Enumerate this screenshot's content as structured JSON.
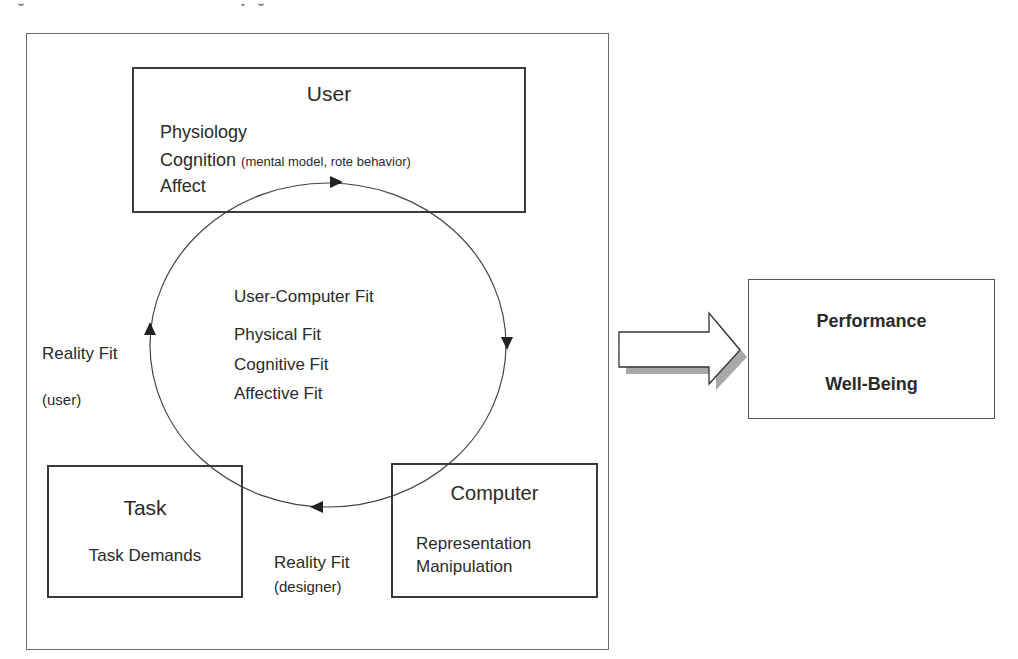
{
  "diagram": {
    "user_box": {
      "title": "User",
      "items": [
        {
          "main": "Physiology",
          "detail": ""
        },
        {
          "main": "Cognition",
          "detail": "(mental model, rote behavior)"
        },
        {
          "main": "Affect",
          "detail": ""
        }
      ]
    },
    "center": {
      "title": "User-Computer Fit",
      "items": [
        "Physical Fit",
        "Cognitive Fit",
        "Affective Fit"
      ]
    },
    "reality_fit_user": {
      "label": "Reality Fit",
      "sub": "(user)"
    },
    "reality_fit_designer": {
      "label": "Reality Fit",
      "sub": "(designer)"
    },
    "task_box": {
      "title": "Task",
      "items": [
        "Task Demands"
      ]
    },
    "computer_box": {
      "title": "Computer",
      "items": [
        "Representation",
        "Manipulation"
      ]
    },
    "outcome_box": {
      "items": [
        "Performance",
        "Well-Being"
      ]
    },
    "colors": {
      "line": "#3a3a3a",
      "frame": "#6a6a6a",
      "arrow_shadow": "#a8a8a8",
      "text": "#2a2a2a"
    }
  }
}
